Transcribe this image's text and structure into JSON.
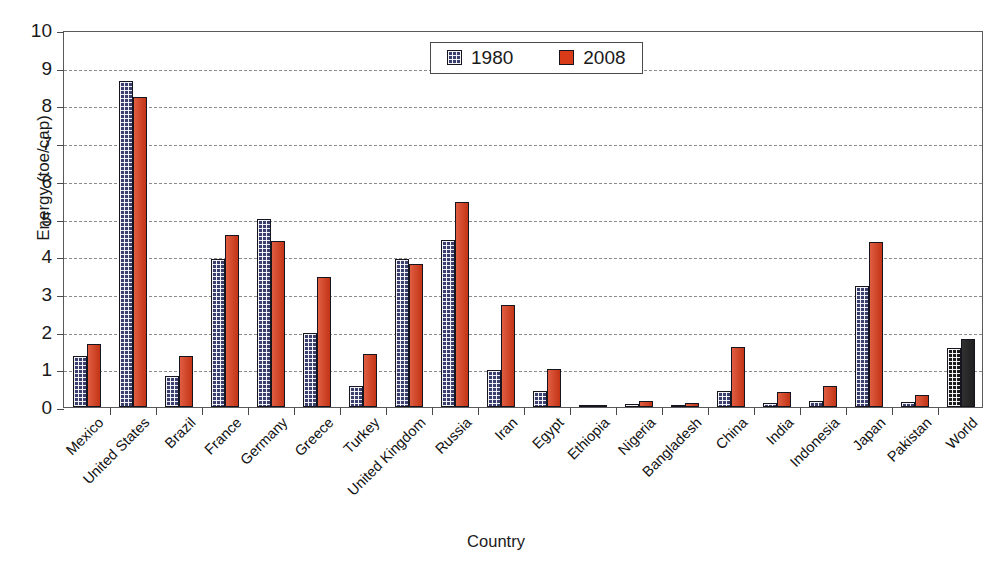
{
  "chart_data": {
    "type": "bar",
    "title": "",
    "xlabel": "Country",
    "ylabel": "Energy (toe/cap)",
    "ylim": [
      0,
      10
    ],
    "yticks": [
      0,
      1,
      2,
      3,
      4,
      5,
      6,
      7,
      8,
      9,
      10
    ],
    "ytick_labels": [
      "0",
      "1",
      "2",
      "3",
      "4",
      "5",
      "6",
      "7",
      "8",
      "9",
      "10"
    ],
    "grid": true,
    "legend_position": "upper center",
    "categories": [
      "Mexico",
      "United States",
      "Brazil",
      "France",
      "Germany",
      "Greece",
      "Turkey",
      "United Kingdom",
      "Russia",
      "Iran",
      "Egypt",
      "Ethiopia",
      "Nigeria",
      "Bangladesh",
      "China",
      "India",
      "Indonesia",
      "Japan",
      "Pakistan",
      "World"
    ],
    "series": [
      {
        "name": "1980",
        "color": "#3a3f6e",
        "values": [
          1.35,
          8.65,
          0.82,
          3.92,
          5.0,
          1.96,
          0.57,
          3.92,
          4.42,
          0.98,
          0.42,
          0.01,
          0.09,
          0.03,
          0.42,
          0.1,
          0.15,
          3.22,
          0.14,
          1.57
        ]
      },
      {
        "name": "2008",
        "color": "#d93a18",
        "values": [
          1.67,
          8.21,
          1.35,
          4.55,
          4.4,
          3.44,
          1.4,
          3.79,
          5.43,
          2.7,
          1.0,
          0.03,
          0.17,
          0.1,
          1.58,
          0.41,
          0.57,
          4.38,
          0.33,
          1.8
        ]
      }
    ],
    "special_category_color": {
      "category": "World",
      "color": "#1c1c1c",
      "note": "World bars rendered in black"
    }
  },
  "legend": {
    "entries": [
      {
        "label": "1980",
        "swatch": "checkered-navy-swatch"
      },
      {
        "label": "2008",
        "swatch": "solid-red-swatch"
      }
    ]
  },
  "axes": {
    "y_title": "Energy (toe/cap)",
    "x_title": "Country"
  }
}
